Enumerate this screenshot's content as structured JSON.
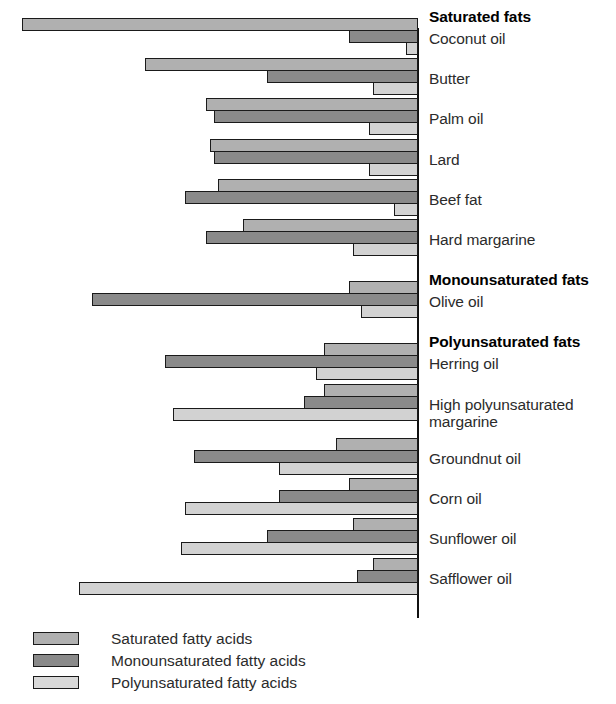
{
  "chart_data": {
    "type": "bar",
    "orientation": "horizontal-right-aligned",
    "title": "",
    "xlabel": "",
    "ylabel": "",
    "grid": false,
    "axis_position": "right",
    "legend_position": "bottom-left",
    "series": [
      {
        "name": "Saturated fatty acids",
        "key": "sat",
        "color": "#b0b0b0"
      },
      {
        "name": "Monounsaturated fatty acids",
        "key": "mono",
        "color": "#8a8a8a"
      },
      {
        "name": "Polyunsaturated fatty acids",
        "key": "poly",
        "color": "#d2d2d2"
      }
    ],
    "groups": [
      {
        "heading": "Saturated fats",
        "items": [
          {
            "label": "Coconut oil",
            "sat": 97,
            "mono": 17,
            "poly": 3
          },
          {
            "label": "Butter",
            "sat": 67,
            "mono": 37,
            "poly": 11
          },
          {
            "label": "Palm oil",
            "sat": 52,
            "mono": 50,
            "poly": 12
          },
          {
            "label": "Lard",
            "sat": 51,
            "mono": 50,
            "poly": 12
          },
          {
            "label": "Beef fat",
            "sat": 49,
            "mono": 57,
            "poly": 6
          },
          {
            "label": "Hard margarine",
            "sat": 43,
            "mono": 52,
            "poly": 16
          }
        ]
      },
      {
        "heading": "Monounsaturated fats",
        "items": [
          {
            "label": "Olive oil",
            "sat": 17,
            "mono": 80,
            "poly": 14
          }
        ]
      },
      {
        "heading": "Polyunsaturated fats",
        "items": [
          {
            "label": "Herring oil",
            "sat": 23,
            "mono": 62,
            "poly": 25
          },
          {
            "label": "High polyunsaturated\nmargarine",
            "sat": 23,
            "mono": 28,
            "poly": 60
          },
          {
            "label": "Groundnut oil",
            "sat": 20,
            "mono": 55,
            "poly": 34
          },
          {
            "label": "Corn oil",
            "sat": 17,
            "mono": 34,
            "poly": 57
          },
          {
            "label": "Sunflower oil",
            "sat": 16,
            "mono": 37,
            "poly": 58
          },
          {
            "label": "Safflower oil",
            "sat": 11,
            "mono": 15,
            "poly": 83
          }
        ]
      }
    ]
  },
  "legend": {
    "items": [
      {
        "label": "Saturated fatty acids",
        "key": "sat"
      },
      {
        "label": "Monounsaturated fatty acids",
        "key": "mono"
      },
      {
        "label": "Polyunsaturated fatty acids",
        "key": "poly"
      }
    ]
  }
}
